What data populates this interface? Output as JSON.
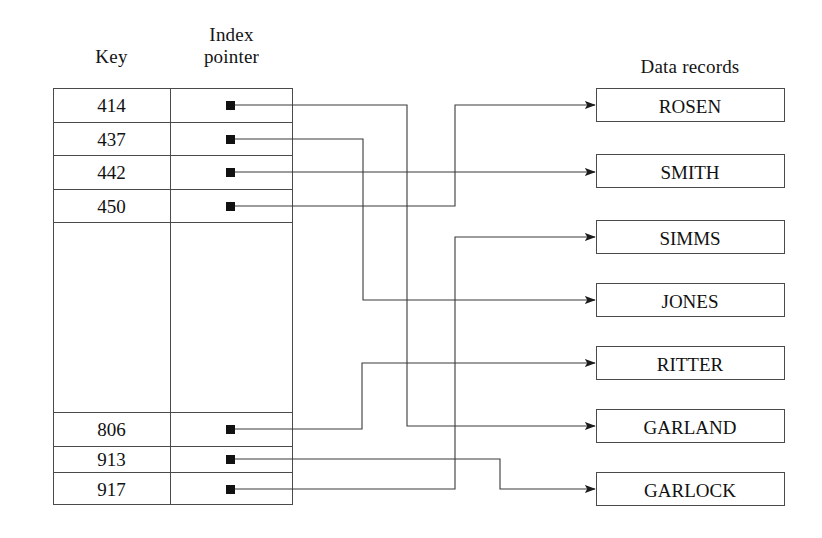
{
  "diagram": {
    "title_index_key": "Key",
    "title_index_pointer_line1": "Index",
    "title_index_pointer_line2": "pointer",
    "title_data_records": "Data records",
    "pointer_glyph": "filled-square",
    "line_color": "#3a3a3a",
    "box_border_color": "#4a4a4a",
    "text_color": "#141414",
    "background": "#ffffff"
  },
  "index_table": {
    "columns": [
      "Key",
      "Index pointer"
    ],
    "rows": [
      {
        "key": "414",
        "pointer": "filled-square",
        "has_entry": true
      },
      {
        "key": "437",
        "pointer": "filled-square",
        "has_entry": true
      },
      {
        "key": "442",
        "pointer": "filled-square",
        "has_entry": true
      },
      {
        "key": "450",
        "pointer": "filled-square",
        "has_entry": true
      },
      {
        "key": "",
        "pointer": "",
        "has_entry": false
      },
      {
        "key": "806",
        "pointer": "filled-square",
        "has_entry": true
      },
      {
        "key": "913",
        "pointer": "filled-square",
        "has_entry": true
      },
      {
        "key": "917",
        "pointer": "filled-square",
        "has_entry": true
      }
    ]
  },
  "data_records": [
    {
      "name": "ROSEN"
    },
    {
      "name": "SMITH"
    },
    {
      "name": "SIMMS"
    },
    {
      "name": "JONES"
    },
    {
      "name": "RITTER"
    },
    {
      "name": "GARLAND"
    },
    {
      "name": "GARLOCK"
    }
  ],
  "links": [
    {
      "from_key": "414",
      "to_record": "GARLAND"
    },
    {
      "from_key": "437",
      "to_record": "JONES"
    },
    {
      "from_key": "442",
      "to_record": "SMITH"
    },
    {
      "from_key": "450",
      "to_record": "ROSEN"
    },
    {
      "from_key": "806",
      "to_record": "RITTER"
    },
    {
      "from_key": "913",
      "to_record": "GARLOCK"
    },
    {
      "from_key": "917",
      "to_record": "SIMMS"
    }
  ]
}
